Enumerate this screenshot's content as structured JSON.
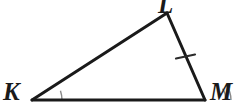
{
  "figure": {
    "kind": "geometry-diagram",
    "shape": "triangle",
    "name": "triangle-KLM",
    "canvas": {
      "width": 242,
      "height": 107,
      "background": "#ffffff"
    },
    "colors": {
      "stroke": "#1a1a1a",
      "label": "#1a1a1a",
      "arc": "#8a8a8a",
      "tick": "#2b2b2b",
      "background": "#ffffff"
    },
    "stroke_width": 3,
    "vertices": [
      {
        "name": "K",
        "label": "K",
        "x": 32,
        "y": 100
      },
      {
        "name": "L",
        "label": "L",
        "x": 167,
        "y": 13
      },
      {
        "name": "M",
        "label": "M",
        "x": 205,
        "y": 100
      }
    ],
    "sides": [
      {
        "name": "side-KL",
        "from": "K",
        "to": "L",
        "ticks": 0
      },
      {
        "name": "side-LM",
        "from": "L",
        "to": "M",
        "ticks": 1
      },
      {
        "name": "side-KM",
        "from": "K",
        "to": "M",
        "ticks": 0
      }
    ],
    "angle_marks": [
      {
        "name": "angle-K",
        "vertex": "K",
        "arcs": 1,
        "radius": 30
      },
      {
        "name": "angle-M",
        "vertex": "M",
        "arcs": 2,
        "radius": 26
      }
    ],
    "tick_marks": [
      {
        "name": "tick-LM",
        "on_side": "side-LM",
        "count": 1,
        "position": 0.5
      }
    ],
    "labels": {
      "K": "K",
      "L": "L",
      "M": "M"
    }
  }
}
